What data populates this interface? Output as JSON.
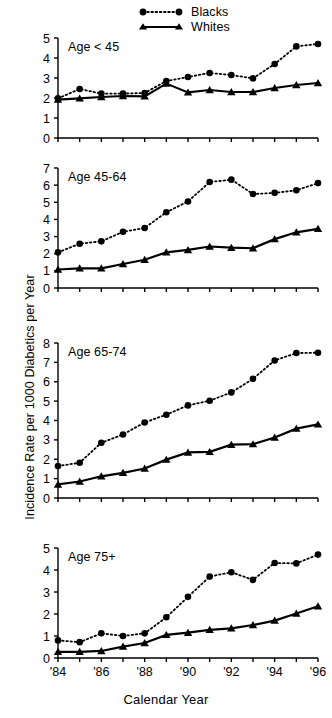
{
  "figure": {
    "xlabel": "Calendar Year",
    "ylabel": "Incidence Rate per 1000 Diabetics per Year"
  },
  "legend": {
    "entries": [
      {
        "label": "Blacks",
        "marker": "circle",
        "line": "dotted"
      },
      {
        "label": "Whites",
        "marker": "triangle",
        "line": "solid"
      }
    ]
  },
  "chart_data": [
    {
      "type": "line",
      "title": "Age < 45",
      "xlabel": "Calendar Year",
      "ylabel": "Incidence Rate per 1000 Diabetics per Year",
      "x": [
        1984,
        1985,
        1986,
        1987,
        1988,
        1989,
        1990,
        1991,
        1992,
        1993,
        1994,
        1995,
        1996
      ],
      "tick_labels": [
        "'84",
        "",
        "'86",
        "",
        "'88",
        "",
        "'90",
        "",
        "'92",
        "",
        "'94",
        "",
        "'96"
      ],
      "ylim": [
        0,
        5
      ],
      "yticks": [
        0,
        1,
        2,
        3,
        4,
        5
      ],
      "grid": false,
      "legend_position": "top",
      "series": [
        {
          "name": "Blacks",
          "values": [
            1.98,
            2.45,
            2.22,
            2.22,
            2.25,
            2.85,
            3.05,
            3.25,
            3.15,
            2.98,
            3.7,
            4.58,
            4.7
          ]
        },
        {
          "name": "Whites",
          "values": [
            1.92,
            1.98,
            2.05,
            2.1,
            2.08,
            2.72,
            2.28,
            2.4,
            2.3,
            2.3,
            2.5,
            2.65,
            2.75
          ]
        }
      ]
    },
    {
      "type": "line",
      "title": "Age 45-64",
      "xlabel": "Calendar Year",
      "ylabel": "Incidence Rate per 1000 Diabetics per Year",
      "x": [
        1984,
        1985,
        1986,
        1987,
        1988,
        1989,
        1990,
        1991,
        1992,
        1993,
        1994,
        1995,
        1996
      ],
      "tick_labels": [
        "'84",
        "",
        "'86",
        "",
        "'88",
        "",
        "'90",
        "",
        "'92",
        "",
        "'94",
        "",
        "'96"
      ],
      "ylim": [
        0,
        7
      ],
      "yticks": [
        0,
        1,
        2,
        3,
        4,
        5,
        6,
        7
      ],
      "grid": false,
      "legend_position": "top",
      "series": [
        {
          "name": "Blacks",
          "values": [
            2.08,
            2.58,
            2.72,
            3.28,
            3.5,
            4.42,
            5.05,
            6.18,
            6.32,
            5.48,
            5.55,
            5.7,
            6.12
          ]
        },
        {
          "name": "Whites",
          "values": [
            1.08,
            1.15,
            1.15,
            1.4,
            1.65,
            2.08,
            2.22,
            2.42,
            2.35,
            2.32,
            2.85,
            3.25,
            3.45
          ]
        }
      ]
    },
    {
      "type": "line",
      "title": "Age 65-74",
      "xlabel": "Calendar Year",
      "ylabel": "Incidence Rate per 1000 Diabetics per Year",
      "x": [
        1984,
        1985,
        1986,
        1987,
        1988,
        1989,
        1990,
        1991,
        1992,
        1993,
        1994,
        1995,
        1996
      ],
      "tick_labels": [
        "'84",
        "",
        "'86",
        "",
        "'88",
        "",
        "'90",
        "",
        "'92",
        "",
        "'94",
        "",
        "'96"
      ],
      "ylim": [
        0,
        8
      ],
      "yticks": [
        0,
        1,
        2,
        3,
        4,
        5,
        6,
        7,
        8
      ],
      "grid": false,
      "legend_position": "top",
      "series": [
        {
          "name": "Blacks",
          "values": [
            1.65,
            1.82,
            2.85,
            3.28,
            3.9,
            4.3,
            4.78,
            5.02,
            5.45,
            6.15,
            7.1,
            7.48,
            7.5
          ]
        },
        {
          "name": "Whites",
          "values": [
            0.7,
            0.85,
            1.12,
            1.3,
            1.52,
            1.98,
            2.35,
            2.38,
            2.75,
            2.78,
            3.12,
            3.58,
            3.8
          ]
        }
      ]
    },
    {
      "type": "line",
      "title": "Age 75+",
      "xlabel": "Calendar Year",
      "ylabel": "Incidence Rate per 1000 Diabetics per Year",
      "x": [
        1984,
        1985,
        1986,
        1987,
        1988,
        1989,
        1990,
        1991,
        1992,
        1993,
        1994,
        1995,
        1996
      ],
      "tick_labels": [
        "'84",
        "",
        "'86",
        "",
        "'88",
        "",
        "'90",
        "",
        "'92",
        "",
        "'94",
        "",
        "'96"
      ],
      "ylim": [
        0,
        5
      ],
      "yticks": [
        0,
        1,
        2,
        3,
        4,
        5
      ],
      "grid": false,
      "legend_position": "top",
      "series": [
        {
          "name": "Blacks",
          "values": [
            0.8,
            0.72,
            1.12,
            1.0,
            1.12,
            1.85,
            2.78,
            3.7,
            3.9,
            3.55,
            4.32,
            4.3,
            4.7
          ]
        },
        {
          "name": "Whites",
          "values": [
            0.28,
            0.28,
            0.32,
            0.52,
            0.68,
            1.05,
            1.15,
            1.28,
            1.35,
            1.5,
            1.7,
            2.02,
            2.35
          ]
        }
      ]
    }
  ],
  "style": {
    "ink": "#000000",
    "background": "#ffffff"
  }
}
